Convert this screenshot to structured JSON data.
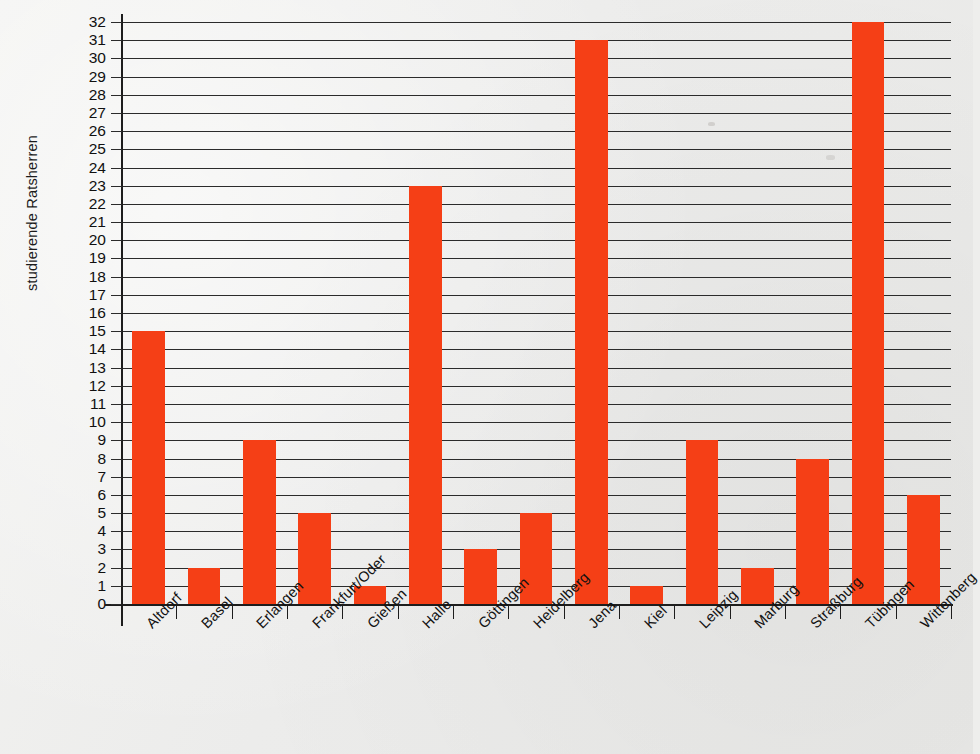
{
  "chart_data": {
    "type": "bar",
    "title": "",
    "xlabel": "",
    "ylabel": "studierende Ratsherren",
    "ylim": [
      0,
      32
    ],
    "ytick_step": 1,
    "grid": true,
    "legend": false,
    "orientation": "vertical",
    "bar_color": "#f53f16",
    "background_color": "#eeeeec",
    "axis_color": "#1d1d1d",
    "categories": [
      "Altdorf",
      "Basel",
      "Erlangen",
      "Frankfurt/Oder",
      "Gießen",
      "Halle",
      "Göttingen",
      "Heidelberg",
      "Jena",
      "Kiel",
      "Leipzig",
      "Marburg",
      "Straßburg",
      "Tübingen",
      "Wittenberg"
    ],
    "values": [
      15,
      2,
      9,
      5,
      1,
      23,
      3,
      5,
      31,
      1,
      9,
      2,
      8,
      32,
      6
    ],
    "ytick_labels": [
      "32",
      "31",
      "30",
      "29",
      "28",
      "27",
      "26",
      "25",
      "24",
      "23",
      "22",
      "21",
      "20",
      "19",
      "18",
      "17",
      "16",
      "15",
      "14",
      "13",
      "12",
      "11",
      "10",
      "9",
      "8",
      "7",
      "6",
      "5",
      "4",
      "3",
      "2",
      "1",
      "0"
    ]
  }
}
